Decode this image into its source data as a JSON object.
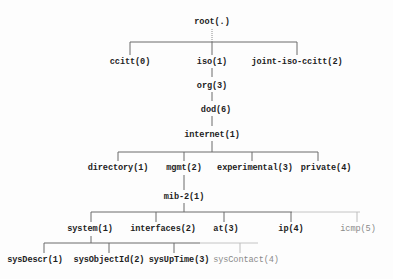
{
  "diagram": {
    "colors": {
      "line": "#6a6a6a",
      "faint_line": "#bdbdbd",
      "text": "#1e1e1e",
      "faint_text": "#8a8a8a"
    },
    "nodes": {
      "root": "root(.)",
      "ccitt": "ccitt(0)",
      "iso": "iso(1)",
      "joint": "joint-iso-ccitt(2)",
      "org": "org(3)",
      "dod": "dod(6)",
      "internet": "internet(1)",
      "directory": "directory(1)",
      "mgmt": "mgmt(2)",
      "experimental": "experimental(3)",
      "private": "private(4)",
      "mib2": "mib-2(1)",
      "system": "system(1)",
      "interfaces": "interfaces(2)",
      "at": "at(3)",
      "ip": "ip(4)",
      "icmp": "icmp(5)",
      "sysDescr": "sysDescr(1)",
      "sysObjectId": "sysObjectId(2)",
      "sysUpTime": "sysUpTime(3)",
      "sysContact": "sysContact(4)"
    }
  }
}
